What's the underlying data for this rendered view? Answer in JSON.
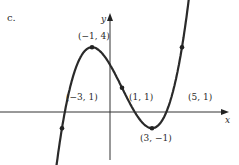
{
  "part_label": "c.",
  "chart_data": {
    "type": "line",
    "title": "",
    "xlabel": "x",
    "ylabel": "y",
    "grid": false,
    "curve": "cubic",
    "points": [
      {
        "x": -3,
        "y": 1,
        "label": "(−3, 1)"
      },
      {
        "x": -1,
        "y": 4,
        "label": "(−1, 4)"
      },
      {
        "x": 1,
        "y": 1,
        "label": "(1, 1)"
      },
      {
        "x": 3,
        "y": -1,
        "label": "(3, −1)"
      },
      {
        "x": 5,
        "y": 1,
        "label": "(5, 1)"
      }
    ],
    "color": "#2a2a2a"
  }
}
